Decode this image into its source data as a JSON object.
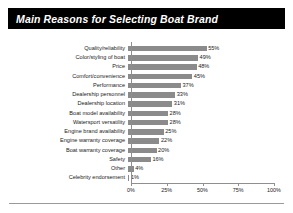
{
  "title": "Main Reasons for Selecting Boat Brand",
  "colors": {
    "banner_background": "#000000",
    "banner_text": "#ffffff",
    "bar": "#8b8b8b",
    "axis": "#8f8f8f",
    "text": "#1b1b1b",
    "page_background": "#ffffff"
  },
  "chart_data": {
    "type": "bar",
    "orientation": "horizontal",
    "title": "Main Reasons for Selecting Boat Brand",
    "xlabel": "",
    "ylabel": "",
    "xlim": [
      0,
      100
    ],
    "grid": false,
    "legend": "none",
    "value_suffix": "%",
    "categories": [
      "Quality/reliability",
      "Color/styling of boat",
      "Price",
      "Comfort/convenience",
      "Performance",
      "Dealership personnel",
      "Dealership location",
      "Boat model availability",
      "Watersport versatility",
      "Engine brand availability",
      "Engine warranty coverage",
      "Boat warranty coverage",
      "Safety",
      "Other",
      "Celebrity endorsement"
    ],
    "values": [
      55,
      49,
      48,
      45,
      37,
      33,
      31,
      28,
      28,
      25,
      22,
      20,
      16,
      4,
      1
    ],
    "value_labels": [
      "55%",
      "49%",
      "48%",
      "45%",
      "37%",
      "33%",
      "31%",
      "28%",
      "28%",
      "25%",
      "22%",
      "20%",
      "16%",
      "4%",
      "1%"
    ],
    "xticks": [
      0,
      25,
      50,
      75,
      100
    ],
    "xtick_labels": [
      "0%",
      "25%",
      "50%",
      "75%",
      "100%"
    ]
  }
}
